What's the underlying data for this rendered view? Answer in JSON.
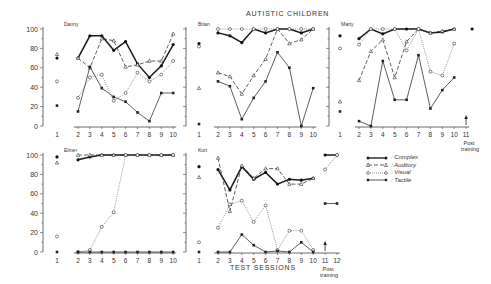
{
  "chart_data": {
    "type": "line",
    "title": "AUTISTIC CHILDREN",
    "ylabel": "% RESPONSES",
    "xlabel": "TEST SESSIONS",
    "ylim": [
      0,
      100
    ],
    "yticks": [
      0,
      20,
      40,
      60,
      80,
      100
    ],
    "legend": [
      {
        "name": "Complex",
        "marker": "filled-circle",
        "line": "solid-thick"
      },
      {
        "name": "Auditory",
        "marker": "triangle",
        "line": "dashed"
      },
      {
        "name": "Visual",
        "marker": "open-circle",
        "line": "dotted"
      },
      {
        "name": "Tactile",
        "marker": "filled-square",
        "line": "solid-thin"
      }
    ],
    "panels": [
      {
        "name": "Danny",
        "sessions": [
          2,
          3,
          4,
          5,
          6,
          7,
          8,
          9,
          10
        ],
        "session1": {
          "Complex": 70,
          "Auditory": 74,
          "Visual": 46,
          "Tactile": 21
        },
        "series": [
          {
            "name": "Complex",
            "values": [
              70,
              93,
              93,
              78,
              87,
              64,
              50,
              62,
              84
            ]
          },
          {
            "name": "Auditory",
            "values": [
              70,
              60,
              90,
              88,
              61,
              63,
              67,
              67,
              95
            ]
          },
          {
            "name": "Visual",
            "values": [
              29,
              50,
              53,
              26,
              34,
              55,
              46,
              53,
              67
            ]
          },
          {
            "name": "Tactile",
            "values": [
              15,
              61,
              39,
              30,
              25,
              14,
              5,
              34,
              34
            ]
          }
        ]
      },
      {
        "name": "Brian",
        "sessions": [
          2,
          3,
          4,
          5,
          6,
          7,
          8,
          9,
          10
        ],
        "session1": {
          "Complex": 85,
          "Auditory": 39,
          "Visual": 82,
          "Tactile": 2
        },
        "series": [
          {
            "name": "Complex",
            "values": [
              96,
              93,
              86,
              100,
              96,
              100,
              100,
              96,
              100
            ]
          },
          {
            "name": "Auditory",
            "values": [
              55,
              51,
              33,
              52,
              69,
              100,
              85,
              89,
              100
            ]
          },
          {
            "name": "Visual",
            "values": [
              100,
              100,
              100,
              100,
              100,
              100,
              100,
              100,
              100
            ]
          },
          {
            "name": "Tactile",
            "values": [
              46,
              41,
              7,
              29,
              46,
              76,
              60,
              0,
              39
            ]
          }
        ]
      },
      {
        "name": "Marty",
        "sessions": [
          2,
          3,
          4,
          5,
          6,
          7,
          8,
          9,
          10,
          11
        ],
        "session1": {
          "Complex": 93,
          "Auditory": 25,
          "Visual": 80,
          "Tactile": 15
        },
        "series": [
          {
            "name": "Complex",
            "values": [
              90,
              100,
              95,
              100,
              100,
              100,
              96,
              97,
              100,
              null
            ]
          },
          {
            "name": "Auditory",
            "values": [
              47,
              77,
              89,
              50,
              87,
              100,
              96,
              98,
              100,
              null
            ]
          },
          {
            "name": "Visual",
            "values": [
              84,
              100,
              100,
              100,
              78,
              100,
              56,
              52,
              85,
              null
            ]
          },
          {
            "name": "Tactile",
            "values": [
              5,
              0,
              67,
              27,
              27,
              73,
              18,
              37,
              50,
              null
            ]
          }
        ],
        "post_training": {
          "session": 11,
          "Complex": 100
        }
      },
      {
        "name": "Elmer",
        "sessions": [
          2,
          3,
          4,
          5,
          6,
          7,
          8,
          9,
          10
        ],
        "session1": {
          "Complex": 98,
          "Auditory": 92,
          "Visual": 16,
          "Tactile": 0
        },
        "series": [
          {
            "name": "Complex",
            "values": [
              95,
              98,
              100,
              100,
              100,
              100,
              100,
              100,
              100
            ]
          },
          {
            "name": "Auditory",
            "values": [
              100,
              100,
              100,
              100,
              100,
              100,
              100,
              100,
              100
            ]
          },
          {
            "name": "Visual",
            "values": [
              0,
              2,
              26,
              41,
              100,
              100,
              100,
              100,
              100
            ]
          },
          {
            "name": "Tactile",
            "values": [
              0,
              0,
              0,
              0,
              0,
              0,
              0,
              0,
              0
            ]
          }
        ]
      },
      {
        "name": "Kurt",
        "sessions": [
          2,
          3,
          4,
          5,
          6,
          7,
          8,
          9,
          10,
          11,
          12
        ],
        "session1": {
          "Complex": 88,
          "Auditory": 77,
          "Visual": 10,
          "Tactile": 0
        },
        "series": [
          {
            "name": "Complex",
            "values": [
              85,
              64,
              88,
              75,
              82,
              70,
              75,
              74,
              76,
              100,
              100
            ]
          },
          {
            "name": "Auditory",
            "values": [
              97,
              42,
              89,
              76,
              86,
              86,
              70,
              70,
              76,
              null,
              null
            ]
          },
          {
            "name": "Visual",
            "values": [
              25,
              49,
              53,
              31,
              48,
              2,
              22,
              22,
              2,
              85,
              100
            ]
          },
          {
            "name": "Tactile",
            "values": [
              0,
              0,
              18,
              7,
              0,
              1,
              0,
              10,
              0,
              50,
              50
            ]
          }
        ],
        "post_training": {
          "sessions": [
            11,
            12
          ]
        }
      }
    ],
    "annotations": [
      "Post training (Marty, session 11)",
      "Post training (Kurt, sessions 11-12)"
    ]
  },
  "labels": {
    "title": "AUTISTIC CHILDREN",
    "ylabel": "% RESPONSES",
    "xlabel": "TEST SESSIONS",
    "post_training_1": "Post",
    "post_training_2": "training",
    "legend_complex": ": Complex",
    "legend_auditory": ": Auditory",
    "legend_visual": ": Visual",
    "legend_tactile": ": Tactile"
  }
}
